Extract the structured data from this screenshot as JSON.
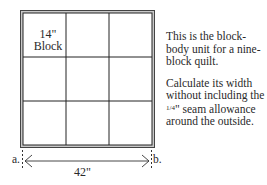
{
  "diagram": {
    "type": "quilt-block-body-grid",
    "grid": {
      "rows": 3,
      "cols": 3
    },
    "block_label_line1": "14\"",
    "block_label_line2": "Block",
    "dimension": {
      "start_label": "a.",
      "end_label": "b.",
      "value_label": "42\""
    }
  },
  "description": {
    "paragraph1": "This is the block-body unit for a nine-block quilt.",
    "paragraph2_part1": "Calculate its width without including the ",
    "fraction": "1/4",
    "paragraph2_part2": "\" seam allowance around the outside."
  }
}
